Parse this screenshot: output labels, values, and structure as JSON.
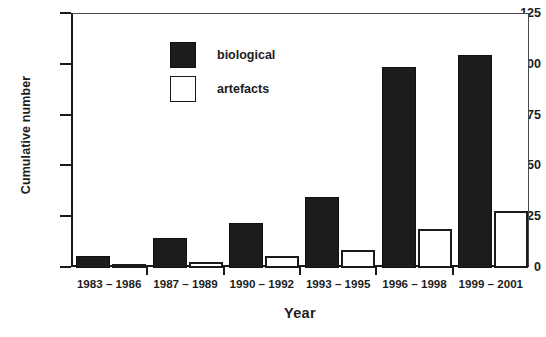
{
  "chart_data": {
    "type": "bar",
    "title": "",
    "xlabel": "Year",
    "ylabel": "Cumulative number",
    "categories": [
      "1983 – 1986",
      "1987 – 1989",
      "1990 – 1992",
      "1993 – 1995",
      "1996 – 1998",
      "1999 – 2001"
    ],
    "series": [
      {
        "name": "biological",
        "color": "#1c1c1c",
        "values": [
          6,
          15,
          22,
          35,
          99,
          105
        ]
      },
      {
        "name": "artefacts",
        "color": "#ffffff",
        "values": [
          1,
          3,
          6,
          9,
          19,
          28
        ]
      }
    ],
    "ylim": [
      0,
      125
    ],
    "yticks": [
      0,
      25,
      50,
      75,
      100,
      125
    ],
    "ytick_labels": [
      "0",
      "25",
      "50",
      "75",
      "100",
      "125"
    ],
    "grid": false,
    "legend_position": "top-left"
  }
}
